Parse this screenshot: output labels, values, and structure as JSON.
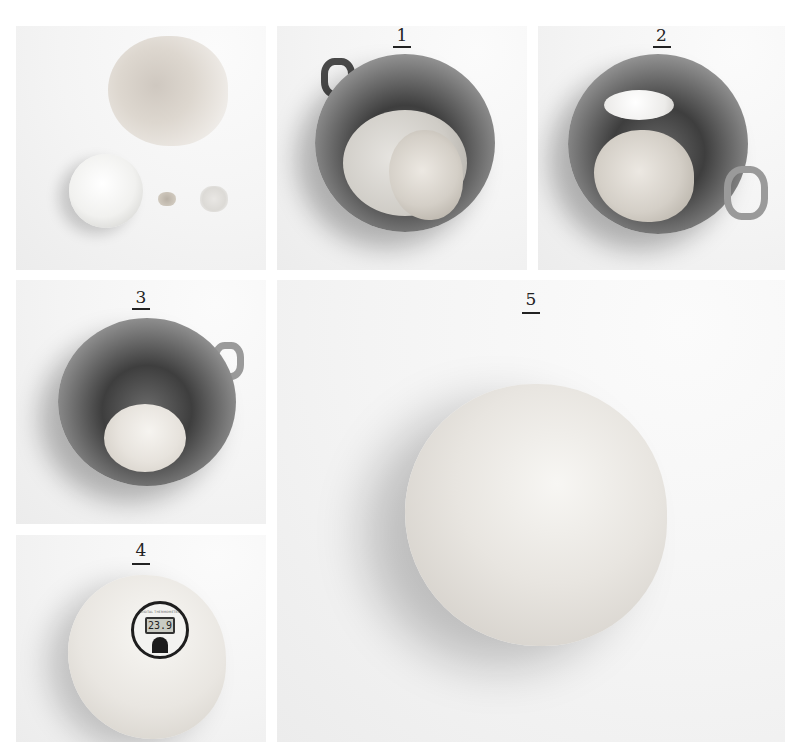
{
  "figure": {
    "panels": [
      {
        "id": "ingredients",
        "label": "",
        "contents": [
          "flour pile",
          "dish of water",
          "yeast",
          "salt"
        ]
      },
      {
        "id": "step1",
        "label": "1",
        "contents": [
          "stand-mixer bowl",
          "water",
          "flour"
        ]
      },
      {
        "id": "step2",
        "label": "2",
        "contents": [
          "stand-mixer bowl",
          "dough hook",
          "shaggy dough"
        ]
      },
      {
        "id": "step3",
        "label": "3",
        "contents": [
          "stand-mixer bowl",
          "smooth dough ball"
        ]
      },
      {
        "id": "step4",
        "label": "4",
        "contents": [
          "dough",
          "digital thermometer"
        ],
        "thermometer": {
          "brand": "DIGITAL THERMOMETER",
          "reading": "23.9"
        }
      },
      {
        "id": "step5",
        "label": "5",
        "contents": [
          "smooth round dough ball"
        ]
      }
    ]
  },
  "colors": {
    "background": "#ffffff",
    "label_text": "#222222",
    "photo_bg": "#f4f4f4"
  }
}
